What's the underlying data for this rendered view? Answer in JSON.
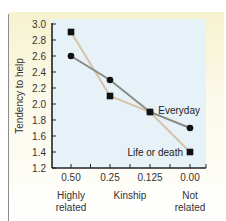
{
  "chart_data": {
    "type": "line",
    "title": "",
    "xlabel": "Kinship",
    "ylabel": "Tendency to help",
    "categories": [
      "0.50",
      "0.25",
      "0.125",
      "0.00"
    ],
    "x_end_labels": {
      "left": [
        "Highly",
        "related"
      ],
      "right": [
        "Not",
        "related"
      ]
    },
    "ylim": [
      1.2,
      3.0
    ],
    "yticks": [
      "1.2",
      "1.4",
      "1.6",
      "1.8",
      "2.0",
      "2.2",
      "2.4",
      "2.6",
      "2.8",
      "3.0"
    ],
    "grid": false,
    "series": [
      {
        "name": "Everyday",
        "marker": "circle",
        "line_color": "#8a8a84",
        "values": [
          2.6,
          2.3,
          1.9,
          1.7
        ]
      },
      {
        "name": "Life or death",
        "marker": "square",
        "line_color": "#d9c3a8",
        "values": [
          2.9,
          2.1,
          1.9,
          1.4
        ]
      }
    ],
    "colors": {
      "plot_background": "#e6f1f8",
      "marker": "#111111",
      "axis": "#222222"
    }
  }
}
